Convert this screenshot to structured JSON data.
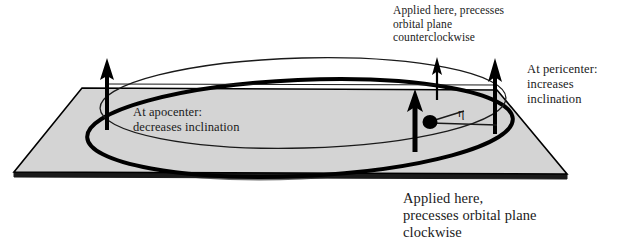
{
  "figure": {
    "colors": {
      "plane_fill": "#d4d4d4",
      "plane_edge": "#000000",
      "plane_thickness": "#1a1a1a",
      "orbit_stroke": "#000000",
      "hidden_arc": "#6b6b6b",
      "text": "#1a1a1a",
      "background": "#ffffff"
    }
  },
  "labels": {
    "top": "Applied here, precesses\norbital plane\ncounterclockwise",
    "pericenter": "At pericenter:\nincreases\ninclination",
    "apocenter": "At apocenter:\ndecreases inclination",
    "bottom": "Applied here,\nprecesses orbital plane\nclockwise",
    "eta": "η"
  },
  "geometry": {
    "plane": {
      "top_left": [
        82,
        88
      ],
      "top_right": [
        497,
        90
      ],
      "bottom_right": [
        567,
        174
      ],
      "bottom_left": [
        14,
        172
      ],
      "thickness_px": 5
    },
    "orbit_ellipse": {
      "center": [
        300,
        128
      ],
      "rx": 213,
      "ry": 48,
      "rotation_deg": -2.5,
      "stroke_width": 4
    },
    "upper_ellipse": {
      "center": [
        303,
        105
      ],
      "rx": 203,
      "ry": 45,
      "rotation_deg": -1.5,
      "stroke_width": 1.4
    },
    "horizontal_connector": {
      "from": [
        107,
        84
      ],
      "to": [
        497,
        85
      ]
    },
    "arrows": [
      {
        "name": "apocenter-arrow",
        "x": 107,
        "base_y": 128,
        "tip_y": 60,
        "style": "thick"
      },
      {
        "name": "middle-thick-arrow",
        "x": 415,
        "base_y": 150,
        "tip_y": 90,
        "style": "thick"
      },
      {
        "name": "middle-thin-arrow",
        "x": 437,
        "base_y": 98,
        "tip_y": 58,
        "style": "thin"
      },
      {
        "name": "pericenter-arrow",
        "x": 495,
        "base_y": 132,
        "tip_y": 60,
        "style": "thick"
      }
    ],
    "central_body": {
      "cx": 430,
      "cy": 122,
      "r": 7
    },
    "eta_leader": {
      "from": [
        436,
        120
      ],
      "to": [
        462,
        111
      ]
    },
    "eta_baseline": {
      "from": [
        430,
        123
      ],
      "to": [
        496,
        125
      ]
    }
  }
}
